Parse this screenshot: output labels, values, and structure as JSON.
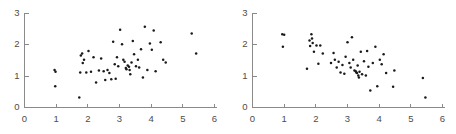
{
  "figure": {
    "width": 456,
    "height": 134,
    "background": "#ffffff",
    "axis_color": "#8a8a8a",
    "label_color": "#4d4d4d",
    "point_color": "#1a1a1a"
  },
  "chart_data": [
    {
      "type": "scatter",
      "title": "",
      "xlabel": "",
      "ylabel": "",
      "xlim": [
        0,
        6
      ],
      "ylim": [
        0,
        3
      ],
      "xticks": [
        0,
        1,
        2,
        3,
        4,
        5,
        6
      ],
      "yticks": [
        0,
        1,
        2,
        3
      ],
      "xticklabels": [
        "0",
        "1",
        "2",
        "3",
        "4",
        "5",
        "6"
      ],
      "yticklabels": [
        "0",
        "1",
        "2",
        "3"
      ],
      "grid": false,
      "legend": null,
      "trend": "positive correlation",
      "marker": "dot",
      "points": [
        [
          0.95,
          1.2
        ],
        [
          0.98,
          1.14
        ],
        [
          0.97,
          0.68
        ],
        [
          1.73,
          0.32
        ],
        [
          1.76,
          1.12
        ],
        [
          1.78,
          1.66
        ],
        [
          1.82,
          1.72
        ],
        [
          1.84,
          1.42
        ],
        [
          1.88,
          1.52
        ],
        [
          1.95,
          1.12
        ],
        [
          2.02,
          1.8
        ],
        [
          2.1,
          1.14
        ],
        [
          2.18,
          1.6
        ],
        [
          2.26,
          0.8
        ],
        [
          2.35,
          1.18
        ],
        [
          2.42,
          1.56
        ],
        [
          2.5,
          1.16
        ],
        [
          2.55,
          0.88
        ],
        [
          2.62,
          1.2
        ],
        [
          2.68,
          1.1
        ],
        [
          2.74,
          0.9
        ],
        [
          2.8,
          2.1
        ],
        [
          2.85,
          1.38
        ],
        [
          2.88,
          0.92
        ],
        [
          2.92,
          1.6
        ],
        [
          2.96,
          1.32
        ],
        [
          3.02,
          2.48
        ],
        [
          3.08,
          2.02
        ],
        [
          3.12,
          1.52
        ],
        [
          3.16,
          1.46
        ],
        [
          3.2,
          1.26
        ],
        [
          3.22,
          1.22
        ],
        [
          3.26,
          1.34
        ],
        [
          3.3,
          1.3
        ],
        [
          3.32,
          1.2
        ],
        [
          3.34,
          1.06
        ],
        [
          3.38,
          1.44
        ],
        [
          3.42,
          2.12
        ],
        [
          3.46,
          1.7
        ],
        [
          3.52,
          1.32
        ],
        [
          3.58,
          1.52
        ],
        [
          3.62,
          1.28
        ],
        [
          3.68,
          1.86
        ],
        [
          3.74,
          0.96
        ],
        [
          3.8,
          2.58
        ],
        [
          3.88,
          1.2
        ],
        [
          3.96,
          2.04
        ],
        [
          4.02,
          1.84
        ],
        [
          4.08,
          2.46
        ],
        [
          4.14,
          1.16
        ],
        [
          4.3,
          2.08
        ],
        [
          4.38,
          1.52
        ],
        [
          4.46,
          1.44
        ],
        [
          5.28,
          2.36
        ],
        [
          5.42,
          1.72
        ]
      ]
    },
    {
      "type": "scatter",
      "title": "",
      "xlabel": "",
      "ylabel": "",
      "xlim": [
        0,
        6
      ],
      "ylim": [
        0,
        3
      ],
      "xticks": [
        0,
        1,
        2,
        3,
        4,
        5,
        6
      ],
      "yticks": [
        0,
        1,
        2,
        3
      ],
      "xticklabels": [
        "0",
        "1",
        "2",
        "3",
        "4",
        "5",
        "6"
      ],
      "yticklabels": [
        "0",
        "1",
        "2",
        "3"
      ],
      "grid": false,
      "legend": null,
      "trend": "negative correlation",
      "marker": "dot",
      "points": [
        [
          0.94,
          2.34
        ],
        [
          1.0,
          2.32
        ],
        [
          0.96,
          1.94
        ],
        [
          1.72,
          1.24
        ],
        [
          1.8,
          2.14
        ],
        [
          1.82,
          1.96
        ],
        [
          1.86,
          2.34
        ],
        [
          1.88,
          2.2
        ],
        [
          1.9,
          2.06
        ],
        [
          1.94,
          1.78
        ],
        [
          2.02,
          1.98
        ],
        [
          2.08,
          1.4
        ],
        [
          2.14,
          1.98
        ],
        [
          2.22,
          1.72
        ],
        [
          2.48,
          1.42
        ],
        [
          2.56,
          1.74
        ],
        [
          2.6,
          1.52
        ],
        [
          2.66,
          1.28
        ],
        [
          2.72,
          1.46
        ],
        [
          2.78,
          1.12
        ],
        [
          2.84,
          1.36
        ],
        [
          2.9,
          1.08
        ],
        [
          2.94,
          1.62
        ],
        [
          3.0,
          2.08
        ],
        [
          3.06,
          1.42
        ],
        [
          3.1,
          1.28
        ],
        [
          3.14,
          2.24
        ],
        [
          3.18,
          1.52
        ],
        [
          3.22,
          1.18
        ],
        [
          3.26,
          1.16
        ],
        [
          3.28,
          1.12
        ],
        [
          3.3,
          1.1
        ],
        [
          3.32,
          1.34
        ],
        [
          3.34,
          1.02
        ],
        [
          3.36,
          0.96
        ],
        [
          3.38,
          1.14
        ],
        [
          3.42,
          1.78
        ],
        [
          3.46,
          1.06
        ],
        [
          3.52,
          1.48
        ],
        [
          3.58,
          1.02
        ],
        [
          3.62,
          1.8
        ],
        [
          3.66,
          1.3
        ],
        [
          3.72,
          0.54
        ],
        [
          3.8,
          1.42
        ],
        [
          3.88,
          1.94
        ],
        [
          3.94,
          0.68
        ],
        [
          4.02,
          1.52
        ],
        [
          4.08,
          1.38
        ],
        [
          4.14,
          1.7
        ],
        [
          4.22,
          1.1
        ],
        [
          4.44,
          0.66
        ],
        [
          4.48,
          1.18
        ],
        [
          5.38,
          0.94
        ],
        [
          5.46,
          0.32
        ]
      ]
    }
  ]
}
